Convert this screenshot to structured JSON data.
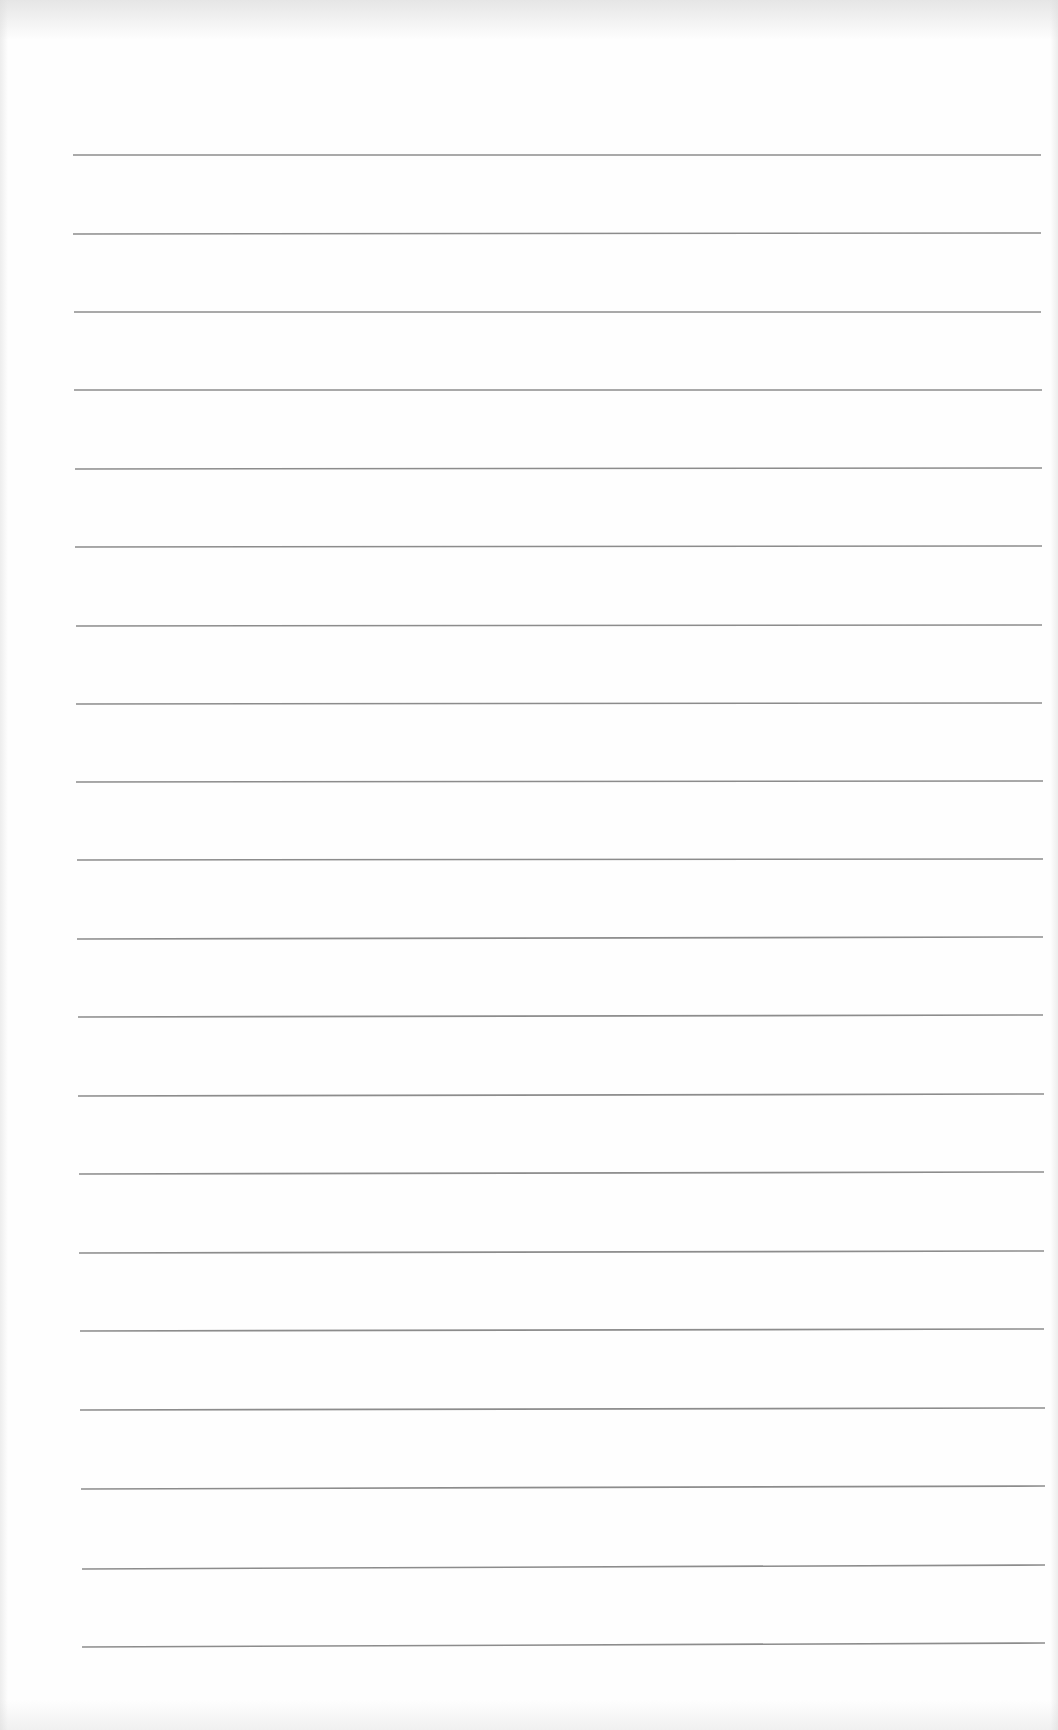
{
  "page": {
    "type": "blank-ruled-paper",
    "background_color": "#fefefe",
    "rule_color": "#8c8c8c",
    "rule_count": 20,
    "rules": [
      {
        "y_left": 155,
        "y_right": 155,
        "x_left": 73,
        "x_right": 1041
      },
      {
        "y_left": 234,
        "y_right": 233,
        "x_left": 73,
        "x_right": 1041
      },
      {
        "y_left": 312,
        "y_right": 312,
        "x_left": 74,
        "x_right": 1041
      },
      {
        "y_left": 390,
        "y_right": 390,
        "x_left": 74,
        "x_right": 1042
      },
      {
        "y_left": 469,
        "y_right": 468,
        "x_left": 75,
        "x_right": 1042
      },
      {
        "y_left": 547,
        "y_right": 546,
        "x_left": 75,
        "x_right": 1042
      },
      {
        "y_left": 626,
        "y_right": 625,
        "x_left": 76,
        "x_right": 1042
      },
      {
        "y_left": 704,
        "y_right": 703,
        "x_left": 76,
        "x_right": 1042
      },
      {
        "y_left": 782,
        "y_right": 781,
        "x_left": 76,
        "x_right": 1043
      },
      {
        "y_left": 860,
        "y_right": 859,
        "x_left": 77,
        "x_right": 1043
      },
      {
        "y_left": 939,
        "y_right": 937,
        "x_left": 77,
        "x_right": 1043
      },
      {
        "y_left": 1017,
        "y_right": 1015,
        "x_left": 78,
        "x_right": 1043
      },
      {
        "y_left": 1096,
        "y_right": 1094,
        "x_left": 78,
        "x_right": 1044
      },
      {
        "y_left": 1174,
        "y_right": 1172,
        "x_left": 79,
        "x_right": 1044
      },
      {
        "y_left": 1253,
        "y_right": 1251,
        "x_left": 79,
        "x_right": 1044
      },
      {
        "y_left": 1331,
        "y_right": 1329,
        "x_left": 80,
        "x_right": 1044
      },
      {
        "y_left": 1410,
        "y_right": 1408,
        "x_left": 80,
        "x_right": 1045
      },
      {
        "y_left": 1489,
        "y_right": 1486,
        "x_left": 81,
        "x_right": 1045
      },
      {
        "y_left": 1569,
        "y_right": 1565,
        "x_left": 82,
        "x_right": 1045
      },
      {
        "y_left": 1647,
        "y_right": 1643,
        "x_left": 82,
        "x_right": 1045
      }
    ]
  }
}
